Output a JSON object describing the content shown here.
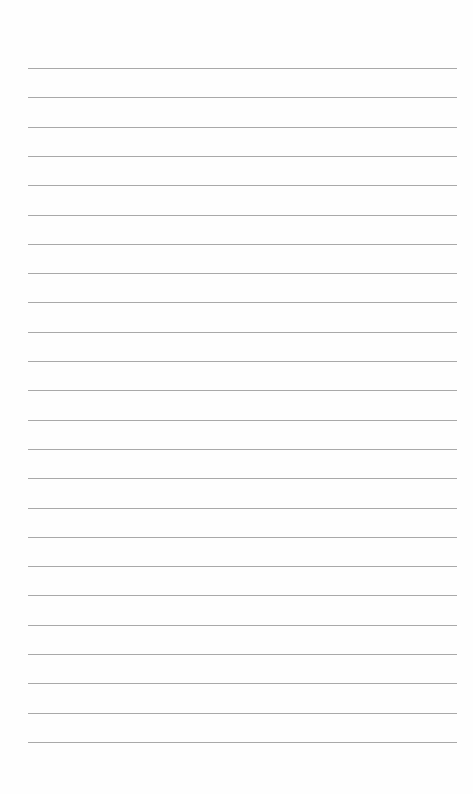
{
  "document": {
    "type": "lined-paper",
    "line_count": 24,
    "line_color": "#9a9a9a",
    "background_color": "#fefefe",
    "text_content": []
  }
}
